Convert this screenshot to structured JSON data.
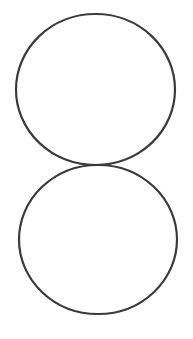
{
  "canvas": {
    "width": 193,
    "height": 339,
    "background": "#ffffff"
  },
  "stroke": {
    "color": "#3a3a3a",
    "width": 2.2
  },
  "shapes": [
    {
      "type": "ellipse",
      "name": "top-circle",
      "cx": 95.5,
      "cy": 89.5,
      "rx": 79.5,
      "ry": 75.5
    },
    {
      "type": "ellipse",
      "name": "bottom-circle",
      "cx": 98,
      "cy": 239.5,
      "rx": 79,
      "ry": 74.5
    }
  ]
}
